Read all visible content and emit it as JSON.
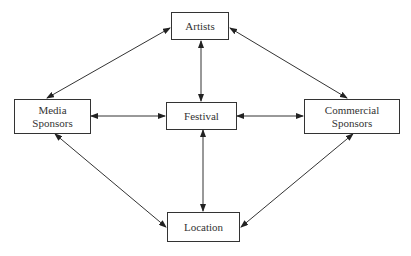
{
  "diagram": {
    "nodes": {
      "artists": {
        "label": "Artists"
      },
      "media": {
        "label": "Media\nSponsors",
        "line1": "Media",
        "line2": "Sponsors"
      },
      "festival": {
        "label": "Festival"
      },
      "commercial": {
        "label": "Commercial\nSponsors",
        "line1": "Commercial",
        "line2": "Sponsors"
      },
      "location": {
        "label": "Location"
      }
    },
    "edges": [
      {
        "from": "artists",
        "to": "media",
        "type": "bidirectional"
      },
      {
        "from": "artists",
        "to": "commercial",
        "type": "bidirectional"
      },
      {
        "from": "artists",
        "to": "festival",
        "type": "bidirectional"
      },
      {
        "from": "media",
        "to": "festival",
        "type": "bidirectional"
      },
      {
        "from": "festival",
        "to": "commercial",
        "type": "bidirectional"
      },
      {
        "from": "festival",
        "to": "location",
        "type": "bidirectional"
      },
      {
        "from": "media",
        "to": "location",
        "type": "bidirectional"
      },
      {
        "from": "commercial",
        "to": "location",
        "type": "bidirectional"
      }
    ]
  }
}
